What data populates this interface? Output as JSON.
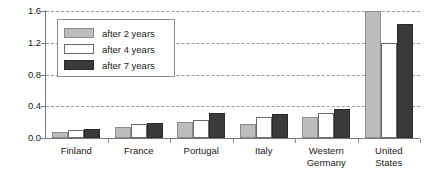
{
  "chart_data": {
    "type": "bar",
    "title": "",
    "subtitle": "",
    "xlabel": "",
    "ylabel": "",
    "ylim": [
      0.0,
      1.6
    ],
    "yticks": [
      "0.0",
      "0.4",
      "0.8",
      "1.2",
      "1.6"
    ],
    "ytick_values": [
      0.0,
      0.4,
      0.8,
      1.2,
      1.6
    ],
    "grid": "horizontal-dashed",
    "legend_position": "upper-left-inside",
    "categories": [
      "Finland",
      "France",
      "Portugal",
      "Italy",
      "Western Germany",
      "United States"
    ],
    "category_lines": [
      [
        "Finland"
      ],
      [
        "France"
      ],
      [
        "Portugal"
      ],
      [
        "Italy"
      ],
      [
        "Western",
        "Germany"
      ],
      [
        "United",
        "States"
      ]
    ],
    "series": [
      {
        "name": "after 2 years",
        "color": "#bdbdbd",
        "values": [
          0.07,
          0.14,
          0.2,
          0.18,
          0.26,
          1.6
        ]
      },
      {
        "name": "after 4 years",
        "color": "#ffffff",
        "values": [
          0.1,
          0.18,
          0.23,
          0.26,
          0.32,
          1.2
        ]
      },
      {
        "name": "after 7 years",
        "color": "#3a3a3a",
        "values": [
          0.11,
          0.19,
          0.32,
          0.3,
          0.37,
          1.43
        ]
      }
    ]
  },
  "legend": {
    "items": [
      {
        "label": "after 2 years",
        "swatch": "light-gray"
      },
      {
        "label": "after 4 years",
        "swatch": "white"
      },
      {
        "label": "after 7 years",
        "swatch": "dark-gray"
      }
    ]
  },
  "colors": {
    "series_after_2_years": "#bdbdbd",
    "series_after_4_years": "#ffffff",
    "series_after_7_years": "#3a3a3a",
    "axis": "#7a7a7a",
    "gridline": "#9a9a9a",
    "text": "#1a1a1a",
    "background": "#ffffff"
  }
}
